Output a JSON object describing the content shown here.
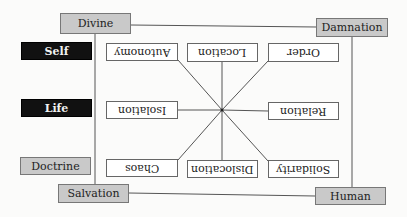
{
  "corners": {
    "top_left": "Divine",
    "top_right": "Damnation",
    "bottom_left": "Salvation",
    "bottom_right": "Human"
  },
  "side_labels": {
    "self": "Self",
    "life": "Life",
    "doctrine": "Doctrine"
  },
  "inner_nodes": {
    "top": [
      "Autonomy",
      "Location",
      "Order"
    ],
    "middle": [
      "Isolation",
      "Relation"
    ],
    "bottom": [
      "Chaos",
      "Dislocation",
      "Solidarity"
    ]
  },
  "colors": {
    "corner_fill": "#c9c9c9",
    "dark_fill": "#111111",
    "line": "#555555"
  }
}
